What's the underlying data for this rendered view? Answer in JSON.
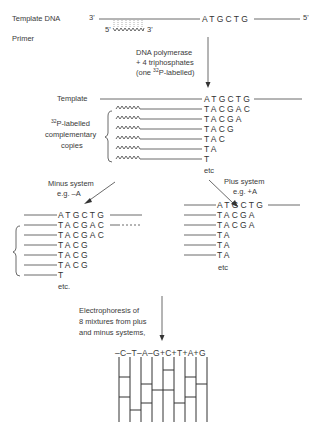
{
  "top": {
    "template_label": "Template DNA",
    "primer_label": "Primer",
    "end3": "3'",
    "end5": "5'",
    "template_seq": "ATGCTG",
    "primer_5": "5'",
    "primer_3": "3'"
  },
  "step1": {
    "line1": "DNA polymerase",
    "line2": "+ 4 triphosphates",
    "line3_pre": "(one ",
    "line3_sup": "32",
    "line3_post": "P-labelled)"
  },
  "copies": {
    "template_label": "Template",
    "template_seq": "ATGCTG",
    "label_sup": "32",
    "label_line1": "P-labelled",
    "label_line2": "complementary",
    "label_line3": "copies",
    "seqs": [
      "TACGAC",
      "TACGA",
      "TACG",
      "TAC",
      "TA",
      "T"
    ],
    "etc": "etc"
  },
  "minus": {
    "title": "Minus system",
    "example": "e.g. –A",
    "template_seq": "ATGCTG",
    "seqs": [
      "TACGAC",
      "TACGAC",
      "TACG",
      "TACG",
      "TACG",
      "T"
    ],
    "etc": "etc."
  },
  "plus": {
    "title": "Plus system",
    "example": "e.g. +A",
    "template_seq": "ATGCTG",
    "seqs": [
      "TACGA",
      "TACGA",
      "TA",
      "TA",
      "TA"
    ],
    "etc": "etc"
  },
  "electrophoresis": {
    "line1": "Electrophoresis of",
    "line2": "8 mixtures from plus",
    "line3": "and minus systems,",
    "lanes_header": "–C–T–A–G+C+T+A+G"
  }
}
